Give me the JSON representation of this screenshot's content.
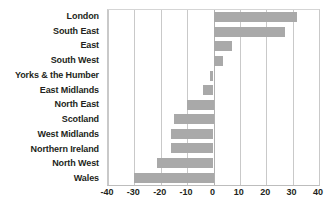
{
  "chart_data": {
    "type": "bar",
    "orientation": "horizontal",
    "title": "",
    "subtitle": "",
    "xlabel": "",
    "ylabel": "",
    "xlim": [
      -40,
      40
    ],
    "xticks": [
      -40,
      -30,
      -20,
      -10,
      0,
      10,
      20,
      30,
      40
    ],
    "xtick_labels": [
      "-40",
      "-30",
      "-20",
      "-10",
      "0",
      "10",
      "20",
      "30",
      "40"
    ],
    "grid": "vertical",
    "legend": "none",
    "bar_color": "#a9a9a9",
    "gridline_color": "#c9c9c9",
    "text_color": "#231f20",
    "categories": [
      "London",
      "South East",
      "East",
      "South West",
      "Yorks & the Humber",
      "East Midlands",
      "North East",
      "Scotland",
      "West Midlands",
      "Northern Ireland",
      "North West",
      "Wales"
    ],
    "values": [
      31.5,
      27,
      7,
      3.5,
      -1.5,
      -4,
      -10,
      -15,
      -16,
      -16,
      -21.5,
      -30
    ]
  }
}
